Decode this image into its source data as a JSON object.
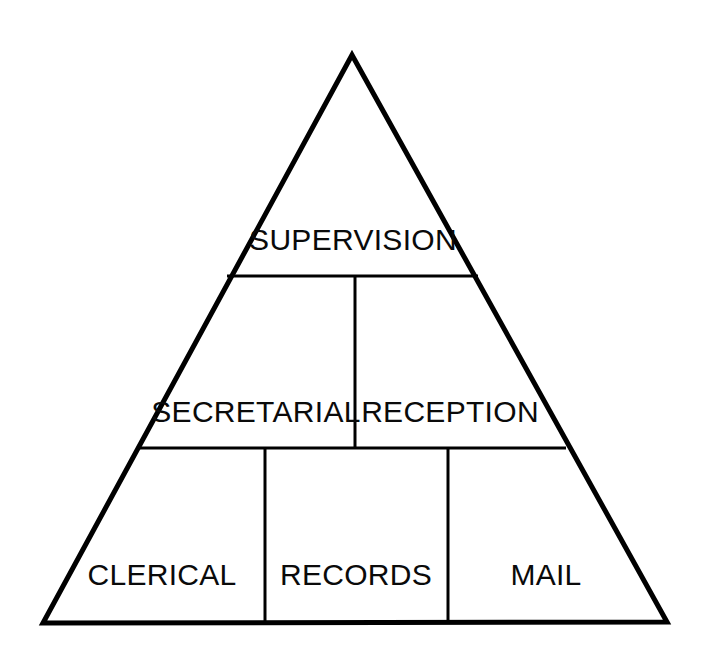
{
  "diagram": {
    "type": "pyramid",
    "title": "",
    "shape": "triangle",
    "background_color": "#ffffff",
    "line_color": "#000000",
    "text_color": "#0a0a0a",
    "geometry": {
      "apex": [
        352,
        55
      ],
      "bottom_left": [
        43,
        623
      ],
      "bottom_right": [
        667,
        622
      ],
      "tier_divider_y": [
        276,
        448
      ],
      "outline_stroke_width": 5,
      "divider_stroke_width": 3
    },
    "tiers": [
      {
        "level": 1,
        "name": "top-tier",
        "cells": [
          {
            "label": "SUPERVISION",
            "name": "supervision",
            "text_x": 353,
            "text_y": 250,
            "font_size": 30
          }
        ]
      },
      {
        "level": 2,
        "name": "middle-tier",
        "divider_x": [
          355
        ],
        "cells": [
          {
            "label": "SECRETARIAL",
            "name": "secretarial",
            "text_x": 256,
            "text_y": 422,
            "font_size": 30
          },
          {
            "label": "RECEPTION",
            "name": "reception",
            "text_x": 450,
            "text_y": 422,
            "font_size": 30
          }
        ]
      },
      {
        "level": 3,
        "name": "bottom-tier",
        "divider_x": [
          265,
          448
        ],
        "cells": [
          {
            "label": "CLERICAL",
            "name": "clerical",
            "text_x": 162,
            "text_y": 585,
            "font_size": 30
          },
          {
            "label": "RECORDS",
            "name": "records",
            "text_x": 356,
            "text_y": 585,
            "font_size": 30
          },
          {
            "label": "MAIL",
            "name": "mail",
            "text_x": 546,
            "text_y": 585,
            "font_size": 30
          }
        ]
      }
    ]
  }
}
